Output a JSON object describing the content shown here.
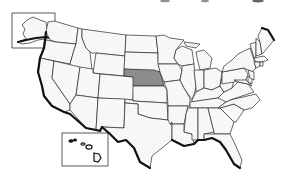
{
  "map": {
    "title": "United States",
    "highlighted_state": "Nebraska",
    "colors": {
      "background": "#ffffff",
      "state_fill": "#f7f7f7",
      "highlight_fill": "#8c8c8c",
      "border": "#2a2a2a",
      "coastline": "#111111"
    },
    "insets": [
      "Alaska",
      "Hawaii"
    ]
  }
}
